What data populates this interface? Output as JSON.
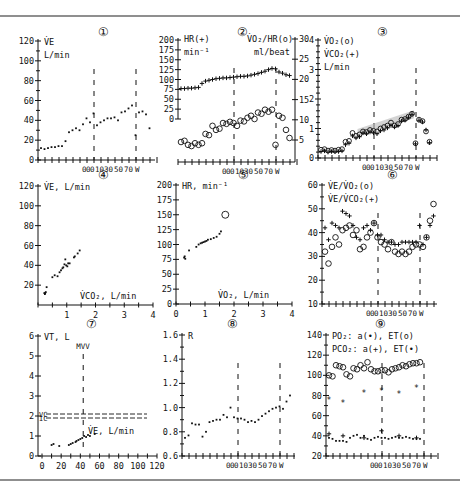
{
  "figure": {
    "border_color": "#6a6a6a",
    "ink_color": "#111111",
    "band_color": "#b8b8b8"
  },
  "chart_data": [
    {
      "panel": 1,
      "panel_label": "①",
      "type": "scatter",
      "ylabel_lines": [
        "V̇E",
        "L/min"
      ],
      "yticks": [
        "0",
        "20",
        "40",
        "60",
        "80",
        "100",
        "120"
      ],
      "ylim": [
        0,
        120
      ],
      "xtick_labels": [
        "0",
        "0",
        "0",
        "10",
        "30",
        "50",
        "70",
        "W"
      ],
      "xlabel": "W",
      "phase_markers_at_index": [
        10,
        26
      ],
      "series": [
        {
          "name": "V̇E",
          "marker": "dot",
          "values": [
            12,
            11,
            12,
            13,
            13,
            14,
            14,
            19,
            28,
            30,
            32,
            30,
            36,
            42,
            38,
            47,
            35,
            38,
            40,
            42,
            42,
            43,
            40,
            48,
            49,
            52,
            55,
            25,
            48,
            49,
            46,
            32
          ]
        }
      ]
    },
    {
      "panel": 2,
      "panel_label": "②",
      "type": "scatter",
      "ylabel_left_lines": [
        "HR(+)",
        "min⁻¹"
      ],
      "ylabel_right_lines": [
        "V̇O₂/HR(o)",
        "ml/beat"
      ],
      "yticks_left": [
        "0",
        "25",
        "50",
        "75",
        "100",
        "125",
        "150",
        "175",
        "200"
      ],
      "ylim_left": [
        0,
        200
      ],
      "yticks_right": [
        "5",
        "10",
        "15",
        "20",
        "25",
        "30"
      ],
      "ylim_right": [
        2.5,
        30
      ],
      "xtick_labels": [
        "0",
        "0",
        "0",
        "10",
        "30",
        "50",
        "70",
        "W"
      ],
      "phase_markers_at_index": [
        10,
        26
      ],
      "series": [
        {
          "name": "HR",
          "marker": "plus",
          "axis": "left",
          "values": [
            77,
            77,
            78,
            78,
            79,
            80,
            90,
            96,
            98,
            100,
            102,
            103,
            104,
            104,
            105,
            106,
            107,
            108,
            108,
            109,
            111,
            113,
            115,
            118,
            121,
            125,
            128,
            127,
            119,
            116,
            112,
            110
          ]
        },
        {
          "name": "V̇O₂/HR",
          "marker": "circle",
          "axis": "right",
          "values": [
            4.5,
            4.8,
            3.8,
            3.5,
            4.2,
            3.8,
            4.2,
            6.5,
            6.2,
            8.5,
            7.5,
            7.8,
            9.2,
            9.0,
            9.5,
            9.2,
            8.5,
            9.8,
            9.6,
            10.5,
            11.0,
            10.2,
            11.8,
            11.5,
            12.5,
            12.0,
            12.5,
            3.8,
            11.0,
            10.5,
            7.5,
            5.5
          ]
        }
      ]
    },
    {
      "panel": 3,
      "panel_label": "③",
      "type": "scatter",
      "ylabel_lines": [
        "V̇O₂(o)",
        "V̇CO₂(+)",
        "L/min"
      ],
      "yticks": [
        "0",
        "1",
        "2",
        "3",
        "4"
      ],
      "ylim": [
        0,
        4
      ],
      "xtick_labels": [
        "0",
        "0",
        "0",
        "10",
        "30",
        "50",
        "70",
        "W"
      ],
      "phase_markers_at_index": [
        10,
        26
      ],
      "shaded_band": "grey regression band along work-rate phase",
      "series": [
        {
          "name": "V̇O₂",
          "marker": "circle",
          "values": [
            0.28,
            0.3,
            0.25,
            0.27,
            0.25,
            0.28,
            0.3,
            0.55,
            0.58,
            0.85,
            0.75,
            0.8,
            0.9,
            0.88,
            0.95,
            0.92,
            0.9,
            1.0,
            1.05,
            1.1,
            1.2,
            1.1,
            1.15,
            1.3,
            1.32,
            1.4,
            1.5,
            0.5,
            1.3,
            1.25,
            0.9,
            0.55
          ]
        },
        {
          "name": "V̇CO₂",
          "marker": "plus",
          "values": [
            0.22,
            0.24,
            0.2,
            0.22,
            0.21,
            0.22,
            0.24,
            0.45,
            0.5,
            0.75,
            0.68,
            0.72,
            0.85,
            0.82,
            0.88,
            0.85,
            0.82,
            0.92,
            0.95,
            1.02,
            1.1,
            1.05,
            1.1,
            1.25,
            1.28,
            1.38,
            1.48,
            0.48,
            1.28,
            1.22,
            0.95,
            0.52
          ]
        }
      ]
    },
    {
      "panel": 4,
      "panel_label": "④",
      "type": "scatter",
      "ylabel": "V̇E, L/min",
      "xlabel": "V̇CO₂, L/min",
      "yticks": [
        "20",
        "40",
        "60",
        "80",
        "100",
        "120"
      ],
      "ylim": [
        0,
        120
      ],
      "xticks": [
        "1",
        "2",
        "3",
        "4"
      ],
      "xlim": [
        0,
        4
      ],
      "series": [
        {
          "name": "V̇E vs V̇CO₂",
          "marker": "dot",
          "points": [
            [
              0.22,
              12
            ],
            [
              0.24,
              11
            ],
            [
              0.25,
              12
            ],
            [
              0.27,
              13
            ],
            [
              0.3,
              18
            ],
            [
              0.5,
              28
            ],
            [
              0.58,
              30
            ],
            [
              0.68,
              29
            ],
            [
              0.75,
              33
            ],
            [
              0.8,
              35
            ],
            [
              0.85,
              37
            ],
            [
              0.88,
              38
            ],
            [
              0.92,
              41
            ],
            [
              0.95,
              46
            ],
            [
              0.98,
              40
            ],
            [
              1.02,
              39
            ],
            [
              1.05,
              42
            ],
            [
              1.1,
              42
            ],
            [
              1.25,
              48
            ],
            [
              1.28,
              49
            ],
            [
              1.38,
              52
            ],
            [
              1.45,
              55
            ]
          ]
        }
      ]
    },
    {
      "panel": 5,
      "panel_label": "⑤",
      "type": "scatter",
      "ylabel": "HR, min⁻¹",
      "xlabel": "V̇O₂, L/min",
      "yticks": [
        "0",
        "25",
        "50",
        "75",
        "100",
        "125",
        "150",
        "175",
        "200"
      ],
      "ylim": [
        0,
        200
      ],
      "xticks": [
        "0",
        "1",
        "2",
        "3",
        "4"
      ],
      "xlim": [
        0,
        4
      ],
      "predicted_max_marker": {
        "x": 1.7,
        "y": 150,
        "marker": "open-circle"
      },
      "series": [
        {
          "name": "HR vs V̇O₂",
          "marker": "dot",
          "points": [
            [
              0.28,
              78
            ],
            [
              0.3,
              80
            ],
            [
              0.32,
              76
            ],
            [
              0.45,
              90
            ],
            [
              0.7,
              96
            ],
            [
              0.78,
              100
            ],
            [
              0.85,
              102
            ],
            [
              0.9,
              103
            ],
            [
              0.95,
              104
            ],
            [
              1.0,
              105
            ],
            [
              1.05,
              106
            ],
            [
              1.1,
              108
            ],
            [
              1.2,
              109
            ],
            [
              1.3,
              111
            ],
            [
              1.4,
              113
            ],
            [
              1.5,
              118
            ],
            [
              1.55,
              122
            ]
          ]
        }
      ]
    },
    {
      "panel": 6,
      "panel_label": "⑥",
      "type": "scatter",
      "ylabel_lines": [
        "V̇E/V̇O₂(o)",
        "V̇E/V̇CO₂(+)"
      ],
      "yticks": [
        "10",
        "20",
        "30",
        "40",
        "50",
        "60"
      ],
      "ylim": [
        10,
        60
      ],
      "xtick_labels": [
        "0",
        "0",
        "0",
        "10",
        "30",
        "50",
        "70",
        "W"
      ],
      "phase_markers_at_index": [
        10,
        26
      ],
      "series": [
        {
          "name": "V̇E/V̇O₂",
          "marker": "circle",
          "values": [
            32,
            27,
            34,
            38,
            35,
            41,
            42,
            43,
            39,
            41,
            33,
            34,
            38,
            40,
            44,
            38,
            36,
            35,
            33,
            36,
            32,
            31,
            32,
            31,
            32,
            34,
            35,
            35,
            34,
            38,
            45,
            52
          ]
        },
        {
          "name": "V̇E/V̇CO₂",
          "marker": "plus",
          "values": [
            42,
            37,
            44,
            43,
            42,
            49,
            48,
            47,
            43,
            38,
            37,
            42,
            43,
            41,
            44,
            39,
            39,
            37,
            36,
            36,
            35,
            35,
            36,
            36,
            36,
            36,
            36,
            43,
            35,
            38,
            43,
            47
          ]
        }
      ]
    },
    {
      "panel": 7,
      "panel_label": "⑦",
      "type": "scatter",
      "ylabel": "VT, L",
      "xlabel": "V̇E, L/min",
      "yticks": [
        "0",
        "1",
        "2",
        "3",
        "4",
        "5",
        "6"
      ],
      "ylim": [
        0,
        6
      ],
      "xticks": [
        "0",
        "20",
        "40",
        "60",
        "80",
        "100",
        "120"
      ],
      "xlim": [
        0,
        120
      ],
      "annotations": [
        {
          "text": "MVV",
          "type": "vertical-dashed",
          "x": 43
        },
        {
          "text": "VC",
          "type": "horizontal-dashed",
          "y": 2.1
        },
        {
          "text": "IC",
          "type": "horizontal-dashed",
          "y": 1.9
        }
      ],
      "series": [
        {
          "name": "VT vs V̇E",
          "marker": "dot",
          "points": [
            [
              10,
              0.55
            ],
            [
              12,
              0.6
            ],
            [
              18,
              0.5
            ],
            [
              28,
              0.55
            ],
            [
              30,
              0.6
            ],
            [
              32,
              0.65
            ],
            [
              35,
              0.7
            ],
            [
              36,
              0.75
            ],
            [
              38,
              0.8
            ],
            [
              40,
              0.85
            ],
            [
              42,
              0.9
            ],
            [
              44,
              1.0
            ],
            [
              46,
              0.95
            ],
            [
              48,
              1.05
            ],
            [
              50,
              1.0
            ],
            [
              55,
              1.1
            ]
          ]
        }
      ]
    },
    {
      "panel": 8,
      "panel_label": "⑧",
      "type": "scatter",
      "ylabel": "R",
      "yticks": [
        "0.6",
        "0.8",
        "1.0",
        "1.2",
        "1.4",
        "1.6"
      ],
      "ylim": [
        0.6,
        1.6
      ],
      "xtick_labels": [
        "0",
        "0",
        "0",
        "10",
        "30",
        "50",
        "70",
        "W"
      ],
      "phase_markers_at_index": [
        10,
        26
      ],
      "series": [
        {
          "name": "R",
          "marker": "dot",
          "values": [
            0.75,
            0.77,
            0.87,
            0.86,
            0.86,
            0.76,
            0.8,
            0.88,
            0.89,
            0.9,
            0.9,
            0.94,
            0.92,
            1.0,
            0.92,
            0.91,
            0.91,
            0.9,
            0.88,
            0.89,
            0.88,
            0.9,
            0.93,
            0.95,
            0.97,
            0.99,
            1.0,
            1.01,
            0.99,
            1.05,
            1.1
          ]
        }
      ]
    },
    {
      "panel": 9,
      "panel_label": "⑨",
      "type": "scatter",
      "ylabel_lines": [
        "PO₂: a(•), ET(o)",
        "PCO₂: a(+), ET(•)"
      ],
      "yticks": [
        "20",
        "40",
        "60",
        "80",
        "100",
        "120",
        "140"
      ],
      "ylim": [
        20,
        140
      ],
      "xtick_labels": [
        "0",
        "0",
        "0",
        "10",
        "30",
        "50",
        "70",
        "W"
      ],
      "phase_markers_at_index": [
        10,
        26
      ],
      "series": [
        {
          "name": "PETO₂",
          "marker": "circle",
          "values": [
            100,
            99,
            110,
            109,
            108,
            101,
            99,
            107,
            106,
            110,
            107,
            113,
            106,
            104,
            104,
            105,
            105,
            103,
            106,
            107,
            108,
            110,
            109,
            111,
            112,
            112,
            113
          ]
        },
        {
          "name": "PaO₂",
          "marker": "star",
          "points": [
            [
              0,
              76
            ],
            [
              4,
              73
            ],
            [
              10,
              82
            ],
            [
              15,
              84
            ],
            [
              20,
              81
            ],
            [
              25,
              87
            ]
          ]
        },
        {
          "name": "PaCO₂",
          "marker": "plus",
          "points": [
            [
              0,
              42
            ],
            [
              4,
              40
            ],
            [
              10,
              38
            ],
            [
              15,
              45
            ],
            [
              20,
              40
            ],
            [
              25,
              38
            ]
          ]
        },
        {
          "name": "PETCO₂",
          "marker": "dot",
          "values": [
            38,
            37,
            35,
            35,
            35,
            34,
            38,
            40,
            41,
            38,
            40,
            37,
            36,
            38,
            39,
            38,
            38,
            37,
            38,
            39,
            38,
            38,
            39,
            38,
            37,
            37,
            37
          ]
        }
      ]
    }
  ]
}
